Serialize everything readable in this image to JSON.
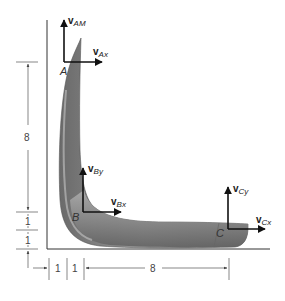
{
  "figure": {
    "points": [
      {
        "id": "A",
        "label": "A",
        "vectors": [
          {
            "base": "v",
            "sub": "AM",
            "dir": "up"
          },
          {
            "base": "v",
            "sub": "Ax",
            "dir": "right"
          }
        ]
      },
      {
        "id": "B",
        "label": "B",
        "vectors": [
          {
            "base": "v",
            "sub": "By",
            "dir": "up"
          },
          {
            "base": "v",
            "sub": "Bx",
            "dir": "right"
          }
        ]
      },
      {
        "id": "C",
        "label": "C",
        "vectors": [
          {
            "base": "v",
            "sub": "Cy",
            "dir": "up"
          },
          {
            "base": "v",
            "sub": "Cx",
            "dir": "right"
          }
        ]
      }
    ],
    "dimensions": {
      "vertical": [
        "8",
        "1",
        "1"
      ],
      "horizontal": [
        "1",
        "1",
        "8"
      ]
    },
    "colors": {
      "body_fill": "#8a8a8a",
      "body_highlight": "#b5b5b5",
      "body_shadow": "#5e5e5e",
      "vector": "#111111",
      "dimension": "#555555"
    }
  }
}
